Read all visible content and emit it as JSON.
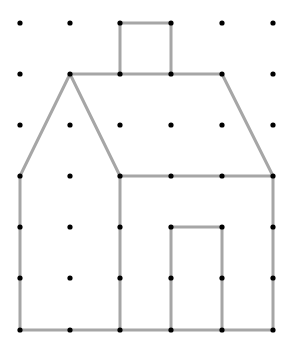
{
  "diagram": {
    "background": "#ffffff",
    "grid": {
      "columns_x": [
        20,
        70,
        120,
        171,
        222,
        273
      ],
      "rows_y": [
        23,
        74,
        125,
        176,
        227,
        278,
        330
      ],
      "dot_color": "#000000",
      "dot_radius": 2.6
    },
    "line_style": {
      "color": "#a6a6a6",
      "width": 3
    },
    "shapes": [
      {
        "name": "chimney",
        "points": [
          [
            120,
            74
          ],
          [
            120,
            23
          ],
          [
            171,
            23
          ],
          [
            171,
            74
          ]
        ]
      },
      {
        "name": "roof-top-edge",
        "points": [
          [
            70,
            74
          ],
          [
            222,
            74
          ]
        ]
      },
      {
        "name": "roof-right-slope",
        "points": [
          [
            222,
            74
          ],
          [
            273,
            176
          ]
        ]
      },
      {
        "name": "gable-left-slope",
        "points": [
          [
            70,
            74
          ],
          [
            20,
            176
          ]
        ]
      },
      {
        "name": "gable-right-slope",
        "points": [
          [
            70,
            74
          ],
          [
            120,
            176
          ]
        ]
      },
      {
        "name": "eave-line",
        "points": [
          [
            120,
            176
          ],
          [
            273,
            176
          ]
        ]
      },
      {
        "name": "left-wall",
        "points": [
          [
            20,
            176
          ],
          [
            20,
            330
          ]
        ]
      },
      {
        "name": "middle-wall",
        "points": [
          [
            120,
            176
          ],
          [
            120,
            330
          ]
        ]
      },
      {
        "name": "right-wall",
        "points": [
          [
            273,
            176
          ],
          [
            273,
            330
          ]
        ]
      },
      {
        "name": "ground-line",
        "points": [
          [
            20,
            330
          ],
          [
            273,
            330
          ]
        ]
      },
      {
        "name": "door",
        "points": [
          [
            171,
            330
          ],
          [
            171,
            227
          ],
          [
            222,
            227
          ],
          [
            222,
            330
          ]
        ]
      }
    ]
  }
}
